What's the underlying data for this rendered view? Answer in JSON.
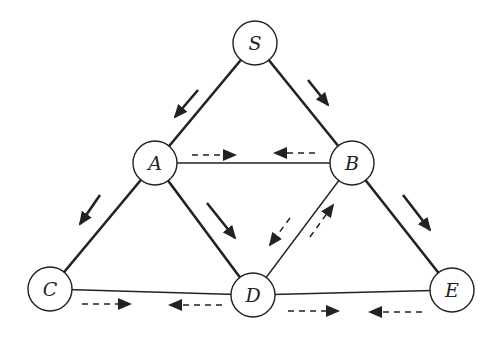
{
  "diagram": {
    "type": "graph",
    "node_radius": 22,
    "colors": {
      "stroke": "#222222",
      "fill": "#ffffff",
      "arrow": "#222222"
    },
    "nodes": [
      {
        "id": "S",
        "label": "S",
        "x": 255,
        "y": 43
      },
      {
        "id": "A",
        "label": "A",
        "x": 155,
        "y": 163
      },
      {
        "id": "B",
        "label": "B",
        "x": 352,
        "y": 163
      },
      {
        "id": "C",
        "label": "C",
        "x": 50,
        "y": 289
      },
      {
        "id": "D",
        "label": "D",
        "x": 253,
        "y": 295
      },
      {
        "id": "E",
        "label": "E",
        "x": 452,
        "y": 290
      }
    ],
    "edges": [
      {
        "from": "S",
        "to": "A",
        "weight": "thick"
      },
      {
        "from": "S",
        "to": "B",
        "weight": "thick"
      },
      {
        "from": "A",
        "to": "C",
        "weight": "thick"
      },
      {
        "from": "A",
        "to": "D",
        "weight": "thick"
      },
      {
        "from": "B",
        "to": "E",
        "weight": "thick"
      },
      {
        "from": "A",
        "to": "B",
        "weight": "thin"
      },
      {
        "from": "B",
        "to": "D",
        "weight": "thin"
      },
      {
        "from": "C",
        "to": "D",
        "weight": "thin"
      },
      {
        "from": "D",
        "to": "E",
        "weight": "thin"
      }
    ],
    "solid_arrows": [
      {
        "x1": 198,
        "y1": 90,
        "x2": 175,
        "y2": 117,
        "desc": "S to A"
      },
      {
        "x1": 308,
        "y1": 80,
        "x2": 328,
        "y2": 105,
        "desc": "S to B"
      },
      {
        "x1": 100,
        "y1": 195,
        "x2": 80,
        "y2": 224,
        "desc": "A to C"
      },
      {
        "x1": 207,
        "y1": 203,
        "x2": 235,
        "y2": 238,
        "desc": "A to D"
      },
      {
        "x1": 403,
        "y1": 195,
        "x2": 430,
        "y2": 230,
        "desc": "B to E"
      }
    ],
    "dashed_arrows": [
      {
        "x1": 192,
        "y1": 155,
        "x2": 235,
        "y2": 155,
        "desc": "A to B"
      },
      {
        "x1": 315,
        "y1": 153,
        "x2": 275,
        "y2": 153,
        "desc": "B to A"
      },
      {
        "x1": 290,
        "y1": 218,
        "x2": 270,
        "y2": 245,
        "desc": "B to D"
      },
      {
        "x1": 310,
        "y1": 237,
        "x2": 333,
        "y2": 205,
        "desc": "D to B"
      },
      {
        "x1": 82,
        "y1": 304,
        "x2": 130,
        "y2": 304,
        "desc": "C to D"
      },
      {
        "x1": 222,
        "y1": 305,
        "x2": 170,
        "y2": 305,
        "desc": "D to C"
      },
      {
        "x1": 288,
        "y1": 311,
        "x2": 338,
        "y2": 311,
        "desc": "D to E"
      },
      {
        "x1": 422,
        "y1": 312,
        "x2": 370,
        "y2": 312,
        "desc": "E to D"
      }
    ]
  }
}
